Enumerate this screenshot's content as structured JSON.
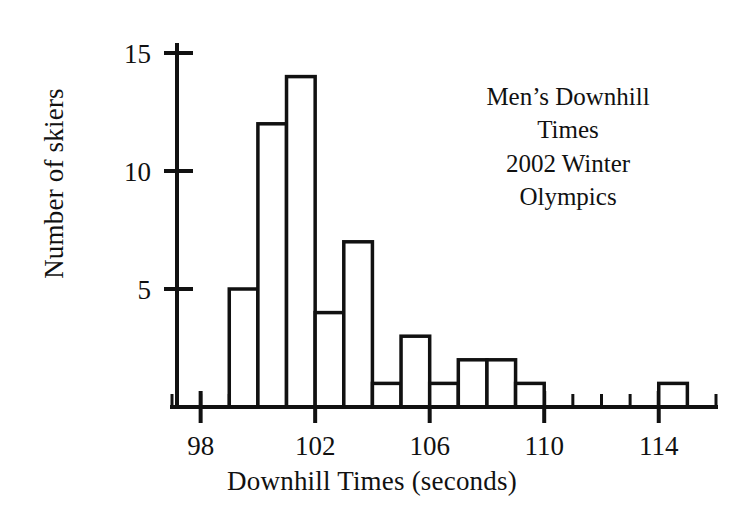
{
  "chart_data": {
    "type": "bar",
    "title_lines": [
      "Men’s Downhill",
      "Times",
      "2002 Winter",
      "Olympics"
    ],
    "xlabel": "Downhill Times (seconds)",
    "ylabel": "Number of skiers",
    "grid": false,
    "legend": "none",
    "xlim": [
      97.0,
      116.0
    ],
    "ylim": [
      0,
      15
    ],
    "x_major_ticks": [
      98,
      102,
      106,
      110,
      114
    ],
    "x_major_tick_labels": [
      "98",
      "102",
      "106",
      "110",
      "114"
    ],
    "x_minor_tick_step": 1,
    "y_ticks": [
      5,
      10,
      15
    ],
    "y_tick_labels": [
      "5",
      "10",
      "15"
    ],
    "bin_width": 1,
    "bins": [
      {
        "start": 99,
        "end": 100,
        "count": 5
      },
      {
        "start": 100,
        "end": 101,
        "count": 12
      },
      {
        "start": 101,
        "end": 102,
        "count": 14
      },
      {
        "start": 102,
        "end": 103,
        "count": 4
      },
      {
        "start": 103,
        "end": 104,
        "count": 7
      },
      {
        "start": 104,
        "end": 105,
        "count": 1
      },
      {
        "start": 105,
        "end": 106,
        "count": 3
      },
      {
        "start": 106,
        "end": 107,
        "count": 1
      },
      {
        "start": 107,
        "end": 108,
        "count": 2
      },
      {
        "start": 108,
        "end": 109,
        "count": 2
      },
      {
        "start": 109,
        "end": 110,
        "count": 1
      },
      {
        "start": 114,
        "end": 115,
        "count": 1
      }
    ],
    "categories": [
      "99-100",
      "100-101",
      "101-102",
      "102-103",
      "103-104",
      "104-105",
      "105-106",
      "106-107",
      "107-108",
      "108-109",
      "109-110",
      "114-115"
    ],
    "values": [
      5,
      12,
      14,
      4,
      7,
      1,
      3,
      1,
      2,
      2,
      1,
      1
    ]
  },
  "colors": {
    "ink": "#111111",
    "background": "#ffffff",
    "bar_fill": "#ffffff",
    "bar_stroke": "#111111"
  }
}
